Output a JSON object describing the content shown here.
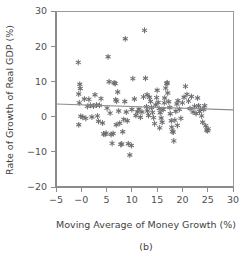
{
  "chart_data": {
    "type": "scatter",
    "title": "",
    "caption": "(b)",
    "xlabel": "Moving Average of Money Growth (%)",
    "ylabel": "Rate of Growth of Real GDP (%)",
    "xlim": [
      -5,
      30
    ],
    "ylim": [
      -20,
      30
    ],
    "xticks": [
      -5,
      0,
      5,
      10,
      15,
      20,
      25,
      30
    ],
    "xticklabels": [
      "-5",
      "-0",
      "5",
      "10",
      "15",
      "20",
      "25",
      "30"
    ],
    "yticks": [
      -20,
      -10,
      0,
      10,
      20,
      30
    ],
    "yticklabels": [
      "-20",
      "-10",
      "0",
      "10",
      "20",
      "30"
    ],
    "grid": false,
    "legend": null,
    "marker": "star-asterisk",
    "marker_color": "#6e6e72",
    "fit_line": {
      "type": "linear-regression",
      "x_start": -5,
      "y_start": 3.6,
      "x_end": 30,
      "y_end": 1.9,
      "slope": -0.049,
      "intercept": 3.36,
      "color": "#8d8d8d"
    },
    "points": [
      [
        -0.6,
        15.4
      ],
      [
        -0.3,
        9.2
      ],
      [
        -0.5,
        6.4
      ],
      [
        -0.4,
        3.9
      ],
      [
        -0.2,
        8.0
      ],
      [
        -0.5,
        -2.3
      ],
      [
        -0.1,
        0.1
      ],
      [
        0.3,
        -0.2
      ],
      [
        0.6,
        5.0
      ],
      [
        0.9,
        -0.5
      ],
      [
        1.2,
        2.9
      ],
      [
        1.5,
        4.9
      ],
      [
        1.8,
        3.2
      ],
      [
        2.1,
        -0.1
      ],
      [
        2.4,
        3.0
      ],
      [
        2.7,
        6.2
      ],
      [
        3.0,
        3.3
      ],
      [
        3.2,
        0.2
      ],
      [
        3.4,
        -1.3
      ],
      [
        3.6,
        3.2
      ],
      [
        3.9,
        5.1
      ],
      [
        4.2,
        -1.8
      ],
      [
        4.4,
        -4.9
      ],
      [
        4.7,
        -5.0
      ],
      [
        4.9,
        -4.7
      ],
      [
        5.1,
        2.4
      ],
      [
        5.3,
        17.0
      ],
      [
        5.5,
        9.9
      ],
      [
        5.7,
        1.0
      ],
      [
        5.9,
        -5.1
      ],
      [
        6.1,
        -7.6
      ],
      [
        6.3,
        -4.8
      ],
      [
        6.5,
        9.6
      ],
      [
        6.7,
        9.4
      ],
      [
        6.8,
        4.8
      ],
      [
        7.0,
        4.4
      ],
      [
        7.2,
        7.0
      ],
      [
        7.4,
        1.6
      ],
      [
        7.6,
        -1.9
      ],
      [
        7.8,
        -7.9
      ],
      [
        8.0,
        -7.8
      ],
      [
        8.2,
        -4.3
      ],
      [
        8.4,
        -0.8
      ],
      [
        8.6,
        4.3
      ],
      [
        8.7,
        22.1
      ],
      [
        8.9,
        1.3
      ],
      [
        9.1,
        -1.2
      ],
      [
        9.3,
        -7.7
      ],
      [
        9.6,
        -10.9
      ],
      [
        9.9,
        -8.2
      ],
      [
        10.2,
        10.8
      ],
      [
        10.5,
        5.0
      ],
      [
        10.8,
        0.3
      ],
      [
        11.1,
        1.3
      ],
      [
        11.4,
        2.1
      ],
      [
        11.7,
        -0.2
      ],
      [
        12.0,
        1.3
      ],
      [
        12.3,
        5.6
      ],
      [
        12.5,
        24.5
      ],
      [
        12.7,
        10.9
      ],
      [
        12.9,
        2.8
      ],
      [
        13.1,
        1.6
      ],
      [
        13.3,
        0.3
      ],
      [
        13.5,
        5.5
      ],
      [
        13.7,
        4.3
      ],
      [
        13.9,
        2.6
      ],
      [
        14.1,
        1.2
      ],
      [
        14.3,
        -0.3
      ],
      [
        14.5,
        -2.0
      ],
      [
        14.7,
        3.3
      ],
      [
        14.9,
        5.4
      ],
      [
        15.0,
        7.5
      ],
      [
        15.2,
        4.0
      ],
      [
        15.4,
        2.3
      ],
      [
        15.6,
        1.1
      ],
      [
        15.8,
        -0.4
      ],
      [
        16.0,
        -1.6
      ],
      [
        16.2,
        2.0
      ],
      [
        16.4,
        3.9
      ],
      [
        16.5,
        5.3
      ],
      [
        16.7,
        8.1
      ],
      [
        16.9,
        9.4
      ],
      [
        17.0,
        9.6
      ],
      [
        17.1,
        6.7
      ],
      [
        17.3,
        4.2
      ],
      [
        17.5,
        2.6
      ],
      [
        17.6,
        0.8
      ],
      [
        17.8,
        -1.2
      ],
      [
        17.9,
        -3.0
      ],
      [
        18.0,
        -4.2
      ],
      [
        18.2,
        -4.4
      ],
      [
        18.3,
        -6.9
      ],
      [
        18.5,
        -1.0
      ],
      [
        18.7,
        1.5
      ],
      [
        18.9,
        3.6
      ],
      [
        19.1,
        4.5
      ],
      [
        19.4,
        2.1
      ],
      [
        19.7,
        -0.5
      ],
      [
        20.0,
        3.9
      ],
      [
        20.3,
        5.5
      ],
      [
        20.6,
        8.6
      ],
      [
        20.9,
        6.3
      ],
      [
        21.2,
        4.4
      ],
      [
        21.5,
        2.3
      ],
      [
        21.8,
        5.7
      ],
      [
        22.1,
        1.3
      ],
      [
        22.4,
        2.9
      ],
      [
        22.7,
        0.9
      ],
      [
        23.0,
        5.3
      ],
      [
        23.2,
        3.1
      ],
      [
        23.4,
        1.4
      ],
      [
        23.6,
        2.2
      ],
      [
        23.8,
        0.2
      ],
      [
        24.0,
        -1.6
      ],
      [
        24.2,
        2.0
      ],
      [
        24.4,
        3.1
      ],
      [
        24.6,
        -2.6
      ],
      [
        24.8,
        -3.8
      ],
      [
        25.0,
        -4.0
      ],
      [
        25.1,
        -3.5
      ],
      [
        6.9,
        -2.3
      ],
      [
        10.0,
        2.0
      ],
      [
        13.0,
        6.2
      ],
      [
        15.5,
        -3.2
      ],
      [
        19.0,
        -2.5
      ]
    ]
  }
}
